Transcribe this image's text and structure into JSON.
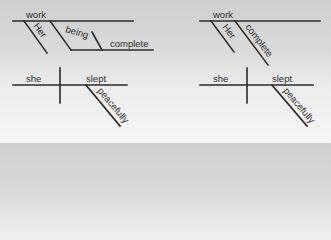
{
  "diagrams": {
    "top_left": {
      "subject": "work",
      "modifier": "Her",
      "participle": "being",
      "complement": "complete"
    },
    "top_right": {
      "subject": "work",
      "modifier": "Her",
      "complement": "complete"
    },
    "bottom_left": {
      "subject": "she",
      "verb": "slept",
      "adverb": "peacefully"
    },
    "bottom_right": {
      "subject": "she",
      "verb": "slept",
      "adverb": "peacefully"
    }
  }
}
